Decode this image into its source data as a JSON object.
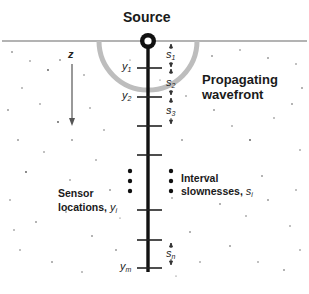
{
  "diagram": {
    "source_label": "Source",
    "wavefront_label_line1": "Propagating",
    "wavefront_label_line2": "wavefront",
    "depth_axis_label": "z",
    "sensor_label_line1": "Sensor",
    "sensor_label_line2": "locations,",
    "sensor_symbol": "y",
    "sensor_symbol_sub": "i",
    "slowness_label_line1": "Interval",
    "slowness_label_line2": "slownesses,",
    "slowness_symbol": "s",
    "slowness_symbol_sub": "i",
    "sensors": [
      {
        "label": "y",
        "sub": "1"
      },
      {
        "label": "y",
        "sub": "2"
      },
      {
        "label": "y",
        "sub": "m"
      }
    ],
    "intervals": [
      {
        "label": "s",
        "sub": "1"
      },
      {
        "label": "s",
        "sub": "2"
      },
      {
        "label": "s",
        "sub": "3"
      },
      {
        "label": "s",
        "sub": "n"
      }
    ],
    "colors": {
      "borehole": "#111111",
      "wavefront": "#b8b8b8",
      "surface": "#9a9a9a",
      "text": "#1a1a1a"
    }
  }
}
